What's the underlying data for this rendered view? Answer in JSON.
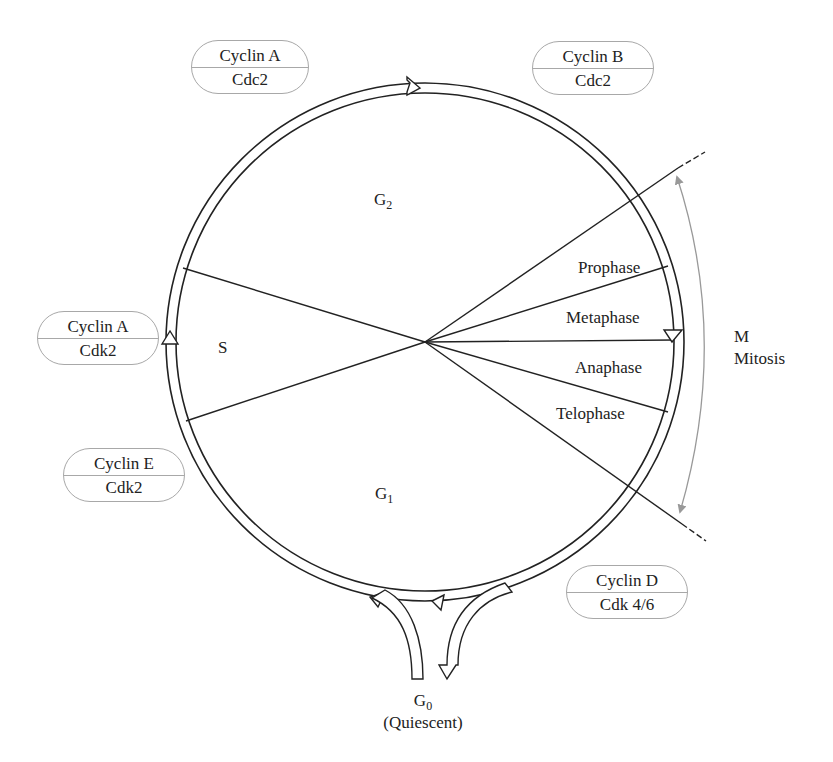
{
  "diagram": {
    "phases": {
      "g2": {
        "main": "G",
        "sub": "2"
      },
      "s": "S",
      "g1": {
        "main": "G",
        "sub": "1"
      },
      "g0": {
        "main": "G",
        "sub": "0",
        "note": "(Quiescent)"
      }
    },
    "mitosis_stages": [
      "Prophase",
      "Metaphase",
      "Anaphase",
      "Telophase"
    ],
    "mitosis_label": {
      "line1": "M",
      "line2": "Mitosis"
    },
    "complexes": [
      {
        "cyclin": "Cyclin A",
        "kinase": "Cdc2"
      },
      {
        "cyclin": "Cyclin B",
        "kinase": "Cdc2"
      },
      {
        "cyclin": "Cyclin A",
        "kinase": "Cdk2"
      },
      {
        "cyclin": "Cyclin E",
        "kinase": "Cdk2"
      },
      {
        "cyclin": "Cyclin D",
        "kinase": "Cdk 4/6"
      }
    ],
    "colors": {
      "line": "#222222",
      "pill_border": "#a8a8a8",
      "mitosis_arrow": "#999999"
    }
  }
}
